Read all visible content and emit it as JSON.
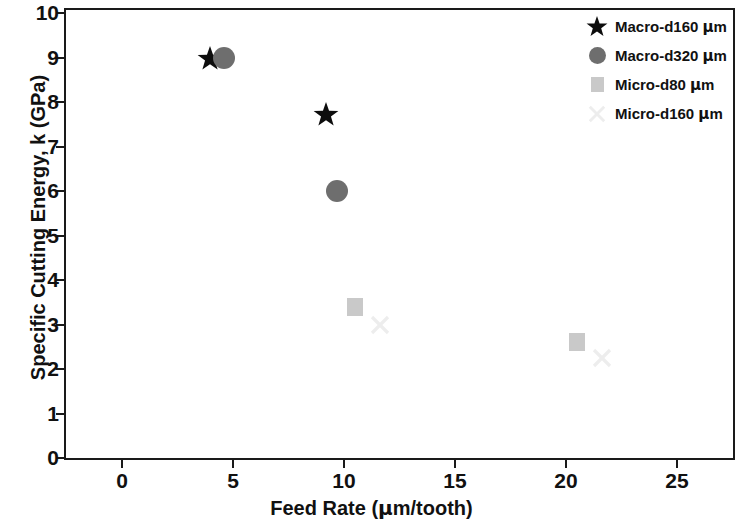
{
  "chart_data": {
    "type": "scatter",
    "title": "",
    "xlabel": "Feed Rate (μm/tooth)",
    "ylabel": "Specific Cutting Energy, k (GPa)",
    "xlim": [
      -1.5,
      27.5
    ],
    "ylim": [
      0,
      10
    ],
    "grid": false,
    "legend_position": "top-right",
    "xticks": [
      0,
      5,
      10,
      15,
      20,
      25
    ],
    "xtick_labels": [
      "0",
      "5",
      "10",
      "15",
      "20",
      "25"
    ],
    "yticks": [
      0,
      1,
      2,
      3,
      4,
      5,
      6,
      7,
      8,
      9,
      10
    ],
    "ytick_labels": [
      "0",
      "1",
      "2",
      "3",
      "4",
      "5",
      "6",
      "7",
      "8",
      "9",
      "10"
    ],
    "series": [
      {
        "name": "Macro-d160 μm",
        "marker": "star",
        "color": "#0d0d0d",
        "size": 26,
        "points": [
          {
            "x": 3.4,
            "y": 9.25
          },
          {
            "x": 8.6,
            "y": 8.0
          }
        ]
      },
      {
        "name": "Macro-d320 μm",
        "marker": "circle",
        "color": "#6e6e6e",
        "size": 22,
        "points": [
          {
            "x": 4.6,
            "y": 9.0
          },
          {
            "x": 9.7,
            "y": 6.0
          }
        ]
      },
      {
        "name": "Micro-d80 μm",
        "marker": "square",
        "color": "#c9c9c9",
        "size": 16,
        "points": [
          {
            "x": 10.5,
            "y": 3.4
          },
          {
            "x": 20.5,
            "y": 2.6
          }
        ]
      },
      {
        "name": "Micro-d160 μm",
        "marker": "cross",
        "color": "#ededed",
        "size": 20,
        "points": [
          {
            "x": 11.6,
            "y": 3.0
          },
          {
            "x": 21.6,
            "y": 2.25
          }
        ]
      }
    ]
  },
  "axes": {
    "x_title": "Feed Rate (μm/tooth)",
    "y_title": "Specific Cutting Energy, k (GPa)"
  },
  "legend": {
    "entries": [
      {
        "label": "Macro-d160 μm",
        "marker": "star",
        "color": "#0d0d0d"
      },
      {
        "label": "Macro-d320 μm",
        "marker": "circle",
        "color": "#6e6e6e"
      },
      {
        "label": "Micro-d80 μm",
        "marker": "square",
        "color": "#c9c9c9"
      },
      {
        "label": "Micro-d160 μm",
        "marker": "cross",
        "color": "#ededed"
      }
    ]
  }
}
